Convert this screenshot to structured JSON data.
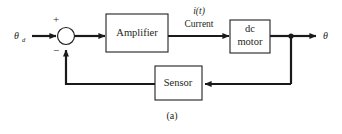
{
  "figure": {
    "caption": "(a)",
    "type": "control-system-block-diagram"
  },
  "colors": {
    "line": "#1a1a1a",
    "box_stroke": "#231f20",
    "background": "#ffffff",
    "text": "#231f20"
  },
  "signals": {
    "input_symbol": "θ",
    "input_subscript": "d",
    "output_symbol": "θ",
    "intermediate_italic": "i(t)",
    "intermediate_name": "Current",
    "plus_sign": "+",
    "minus_sign": "−"
  },
  "blocks": [
    {
      "id": "amplifier",
      "label": "Amplifier",
      "line1": "Amplifier",
      "line2": ""
    },
    {
      "id": "dc-motor",
      "label": "dc motor",
      "line1": "dc",
      "line2": "motor"
    },
    {
      "id": "sensor",
      "label": "Sensor",
      "line1": "Sensor",
      "line2": ""
    }
  ],
  "summing_junction": {
    "name": "summing-junction",
    "positive_input": "+",
    "negative_input": "−"
  }
}
